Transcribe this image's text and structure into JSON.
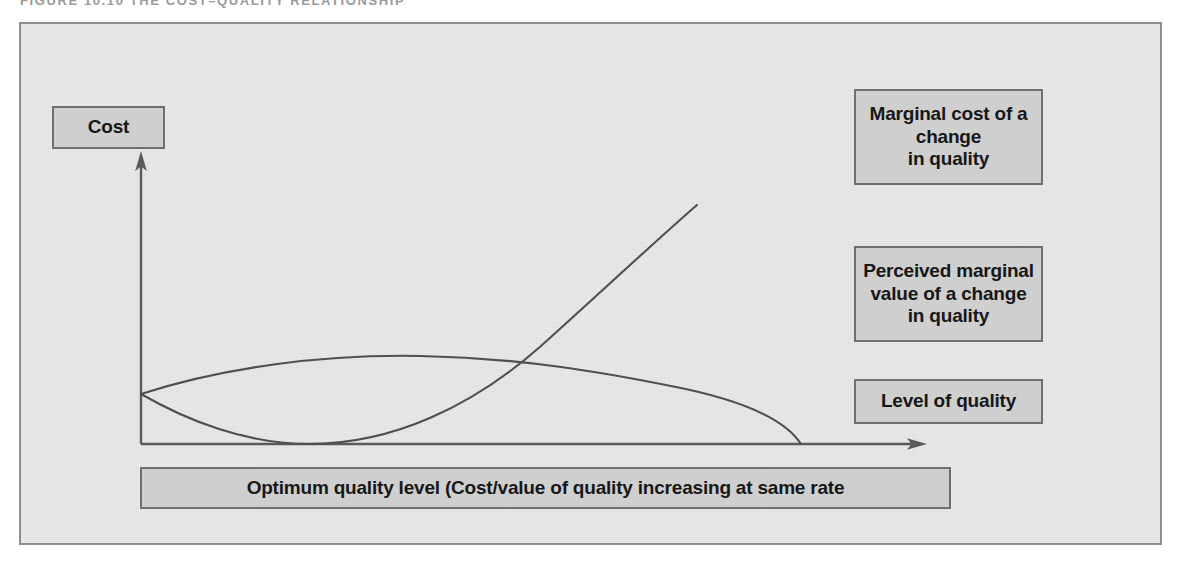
{
  "figure": {
    "caption": "FIGURE 10.10 THE COST–QUALITY RELATIONSHIP"
  },
  "axes": {
    "y_axis_label": "Cost",
    "x_axis_label": "Level of quality"
  },
  "callouts": {
    "marginal_cost": "Marginal cost of a\nchange\nin quality",
    "perceived_value": "Perceived marginal\nvalue of a change\nin quality",
    "level_of_quality": "Level of quality",
    "optimum_quality": "Optimum quality level (Cost/value of quality increasing at same rate"
  },
  "colors": {
    "panel_background": "#e3e3e3",
    "panel_border": "#8d8d8d",
    "box_fill": "#cfcfcf",
    "box_border": "#6f6f6f",
    "curve_stroke": "#4f4f4f",
    "axis_stroke": "#5a5a5a",
    "caption_text": "#9a9a9a",
    "box_text": "#171717"
  },
  "chart_data": {
    "type": "line",
    "title": "FIGURE 10.10 THE COST–QUALITY RELATIONSHIP",
    "xlabel": "Level of quality",
    "ylabel": "Cost",
    "grid": false,
    "legend": "none",
    "axis_arrows": true,
    "xlim": [
      0,
      100
    ],
    "ylim": [
      0,
      100
    ],
    "annotations": [
      "Marginal cost of a change in quality",
      "Perceived marginal value of a change in quality",
      "Level of quality",
      "Optimum quality level (Cost/value of quality increasing at same rate"
    ],
    "intersection": {
      "x": 51,
      "y": 26,
      "note": "Optimum quality level — curves cross"
    },
    "series": [
      {
        "name": "Marginal cost of a change in quality",
        "description": "Starts at the y-axis, dips to touch the x-axis, then rises steeply to the upper right",
        "x": [
          0,
          8,
          14,
          21,
          28,
          35,
          42,
          51,
          58,
          65,
          71,
          78
        ],
        "y": [
          26,
          16,
          8,
          2,
          0,
          2,
          8,
          26,
          44,
          62,
          80,
          94
        ]
      },
      {
        "name": "Perceived marginal value of a change in quality",
        "description": "Starts at the y-axis, rises to a broad plateau, then falls steeply to meet the x-axis",
        "x": [
          0,
          8,
          17,
          26,
          35,
          44,
          51,
          58,
          65,
          72,
          79,
          84
        ],
        "y": [
          26,
          33,
          37,
          38,
          37,
          34,
          31,
          28,
          24,
          19,
          10,
          0
        ]
      }
    ]
  }
}
